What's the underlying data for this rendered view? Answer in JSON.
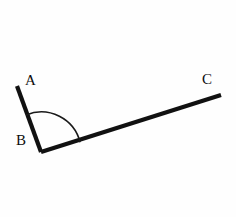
{
  "figure": {
    "type": "angle-diagram",
    "width": 236,
    "height": 217,
    "background_color": "#fefefe",
    "stroke_color": "#111111",
    "stroke_width": 4.2,
    "arc": {
      "name": "angle-arc-at-B",
      "center": [
        41,
        152
      ],
      "radius": 40,
      "stroke_color": "#1a1a1a",
      "stroke_width": 1.6,
      "path": "M 26.1 114.9 A 40 40 0 0 1 80.1 142.3"
    },
    "points": [
      {
        "id": "A",
        "label": "A",
        "x": 17,
        "y": 86,
        "label_x": 25,
        "label_y": 73
      },
      {
        "id": "B",
        "label": "B",
        "x": 41,
        "y": 152,
        "label_x": 16,
        "label_y": 133
      },
      {
        "id": "C",
        "label": "C",
        "x": 221,
        "y": 95,
        "label_x": 202,
        "label_y": 72
      }
    ],
    "segments": [
      {
        "id": "BA",
        "name": "ray-b-to-a",
        "x1": 41,
        "y1": 152,
        "x2": 17,
        "y2": 86
      },
      {
        "id": "BC",
        "name": "ray-b-to-c",
        "x1": 41,
        "y1": 152,
        "x2": 221,
        "y2": 95
      }
    ]
  }
}
